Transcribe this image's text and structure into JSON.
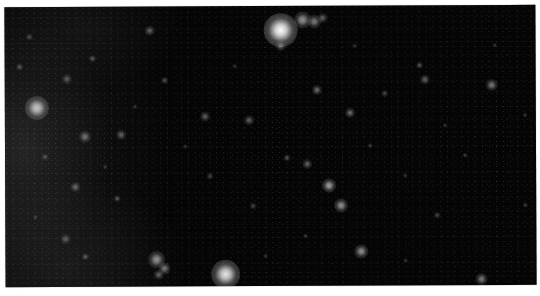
{
  "image": {
    "subject": "star field",
    "background_color": "#050505",
    "border_color": "#ffffff"
  },
  "stars": [
    {
      "x": 276,
      "y": 24,
      "r": 14,
      "b": 1.0
    },
    {
      "x": 298,
      "y": 14,
      "r": 7,
      "b": 0.55
    },
    {
      "x": 310,
      "y": 16,
      "r": 6,
      "b": 0.45
    },
    {
      "x": 318,
      "y": 12,
      "r": 4,
      "b": 0.35
    },
    {
      "x": 276,
      "y": 40,
      "r": 4,
      "b": 0.35
    },
    {
      "x": 32,
      "y": 101,
      "r": 10,
      "b": 0.75
    },
    {
      "x": 220,
      "y": 268,
      "r": 12,
      "b": 0.9
    },
    {
      "x": 151,
      "y": 253,
      "r": 7,
      "b": 0.55
    },
    {
      "x": 159,
      "y": 262,
      "r": 5,
      "b": 0.45
    },
    {
      "x": 153,
      "y": 268,
      "r": 4,
      "b": 0.35
    },
    {
      "x": 324,
      "y": 180,
      "r": 6,
      "b": 0.6
    },
    {
      "x": 336,
      "y": 200,
      "r": 6,
      "b": 0.55
    },
    {
      "x": 356,
      "y": 246,
      "r": 6,
      "b": 0.55
    },
    {
      "x": 476,
      "y": 274,
      "r": 5,
      "b": 0.45
    },
    {
      "x": 302,
      "y": 158,
      "r": 4,
      "b": 0.35
    },
    {
      "x": 282,
      "y": 152,
      "r": 3,
      "b": 0.3
    },
    {
      "x": 312,
      "y": 84,
      "r": 4,
      "b": 0.4
    },
    {
      "x": 345,
      "y": 107,
      "r": 4,
      "b": 0.4
    },
    {
      "x": 420,
      "y": 74,
      "r": 4,
      "b": 0.35
    },
    {
      "x": 487,
      "y": 80,
      "r": 5,
      "b": 0.45
    },
    {
      "x": 415,
      "y": 60,
      "r": 3,
      "b": 0.3
    },
    {
      "x": 145,
      "y": 24,
      "r": 4,
      "b": 0.35
    },
    {
      "x": 62,
      "y": 72,
      "r": 4,
      "b": 0.3
    },
    {
      "x": 88,
      "y": 52,
      "r": 3,
      "b": 0.3
    },
    {
      "x": 160,
      "y": 74,
      "r": 3,
      "b": 0.3
    },
    {
      "x": 200,
      "y": 110,
      "r": 4,
      "b": 0.35
    },
    {
      "x": 244,
      "y": 114,
      "r": 4,
      "b": 0.35
    },
    {
      "x": 80,
      "y": 130,
      "r": 5,
      "b": 0.4
    },
    {
      "x": 116,
      "y": 128,
      "r": 4,
      "b": 0.35
    },
    {
      "x": 70,
      "y": 180,
      "r": 4,
      "b": 0.35
    },
    {
      "x": 112,
      "y": 192,
      "r": 3,
      "b": 0.3
    },
    {
      "x": 60,
      "y": 232,
      "r": 4,
      "b": 0.3
    },
    {
      "x": 80,
      "y": 250,
      "r": 3,
      "b": 0.3
    },
    {
      "x": 15,
      "y": 60,
      "r": 3,
      "b": 0.3
    },
    {
      "x": 25,
      "y": 30,
      "r": 3,
      "b": 0.25
    },
    {
      "x": 205,
      "y": 170,
      "r": 3,
      "b": 0.25
    },
    {
      "x": 248,
      "y": 200,
      "r": 3,
      "b": 0.25
    },
    {
      "x": 380,
      "y": 88,
      "r": 3,
      "b": 0.25
    },
    {
      "x": 432,
      "y": 210,
      "r": 3,
      "b": 0.25
    },
    {
      "x": 460,
      "y": 150,
      "r": 2,
      "b": 0.25
    },
    {
      "x": 520,
      "y": 200,
      "r": 2,
      "b": 0.25
    },
    {
      "x": 365,
      "y": 140,
      "r": 2,
      "b": 0.25
    },
    {
      "x": 300,
      "y": 230,
      "r": 2,
      "b": 0.25
    },
    {
      "x": 400,
      "y": 170,
      "r": 2,
      "b": 0.2
    },
    {
      "x": 490,
      "y": 40,
      "r": 2,
      "b": 0.2
    },
    {
      "x": 520,
      "y": 110,
      "r": 2,
      "b": 0.2
    },
    {
      "x": 350,
      "y": 40,
      "r": 2,
      "b": 0.2
    },
    {
      "x": 230,
      "y": 60,
      "r": 2,
      "b": 0.2
    },
    {
      "x": 180,
      "y": 140,
      "r": 2,
      "b": 0.2
    },
    {
      "x": 130,
      "y": 100,
      "r": 2,
      "b": 0.2
    },
    {
      "x": 40,
      "y": 150,
      "r": 3,
      "b": 0.25
    },
    {
      "x": 100,
      "y": 160,
      "r": 2,
      "b": 0.2
    },
    {
      "x": 30,
      "y": 210,
      "r": 2,
      "b": 0.2
    },
    {
      "x": 260,
      "y": 250,
      "r": 2,
      "b": 0.2
    },
    {
      "x": 400,
      "y": 255,
      "r": 2,
      "b": 0.2
    },
    {
      "x": 440,
      "y": 120,
      "r": 2,
      "b": 0.2
    }
  ]
}
